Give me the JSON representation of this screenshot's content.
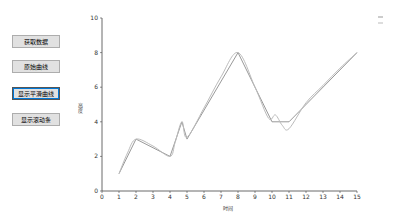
{
  "buttons": [
    {
      "label": "获取数据",
      "top": 35
    },
    {
      "label": "原始曲线",
      "top": 60
    },
    {
      "label": "显示平滑曲线",
      "top": 87,
      "focused": true
    },
    {
      "label": "显示滚动条",
      "top": 113
    }
  ],
  "chart_data": {
    "type": "line",
    "title": "",
    "xlabel": "时间",
    "ylabel": "高度",
    "xlim": [
      0,
      15
    ],
    "ylim": [
      0,
      10
    ],
    "xticks": [
      0,
      1,
      2,
      3,
      4,
      5,
      6,
      7,
      8,
      9,
      10,
      11,
      12,
      13,
      14,
      15
    ],
    "yticks": [
      0,
      2,
      4,
      6,
      8,
      10
    ],
    "series": [
      {
        "name": "原始曲线",
        "color": "#999999",
        "x": [
          1,
          2,
          4,
          4.7,
          5,
          8,
          10,
          11,
          15
        ],
        "y": [
          1,
          3,
          2,
          4,
          3,
          8,
          4,
          4,
          8
        ]
      },
      {
        "name": "平滑曲线",
        "color": "#bbbbbb",
        "x": [
          1,
          1.5,
          2,
          3,
          4,
          4.3,
          4.7,
          5,
          6,
          7,
          8,
          9,
          9.8,
          10.2,
          10.6,
          11,
          12,
          13,
          14,
          15
        ],
        "y": [
          1,
          2.2,
          3,
          2.6,
          2,
          2.8,
          4,
          3.1,
          4.8,
          6.6,
          8,
          6,
          4.2,
          4.4,
          3.8,
          3.6,
          5.1,
          6.1,
          7.1,
          8
        ]
      }
    ],
    "legend": {
      "position": "top-right",
      "entries": [
        "原始曲线",
        "平滑曲线"
      ]
    },
    "grid": false
  }
}
